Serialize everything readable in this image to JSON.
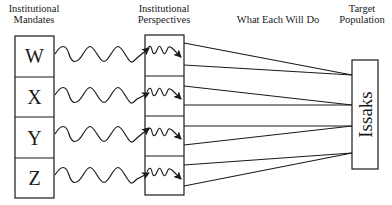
{
  "headers": {
    "mandates": [
      "Institutional",
      "Mandates"
    ],
    "perspectives": [
      "Institutional",
      "Perspectives"
    ],
    "actions": "What Each Will Do",
    "target": [
      "Target",
      "Population"
    ]
  },
  "mandates": [
    {
      "label": "W"
    },
    {
      "label": "X"
    },
    {
      "label": "Y"
    },
    {
      "label": "Z"
    }
  ],
  "target_population": {
    "label": "Issaks"
  },
  "colors": {
    "stroke": "#1a1a1a",
    "background": "#ffffff"
  }
}
